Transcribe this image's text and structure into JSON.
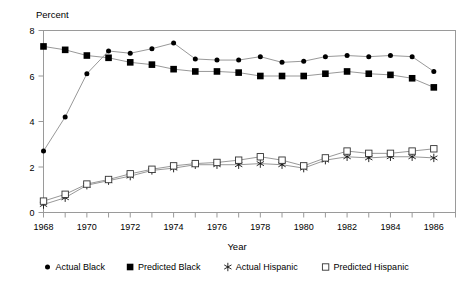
{
  "chart_data": {
    "type": "line",
    "title": "",
    "xlabel": "Year",
    "ylabel": "Percent",
    "ylim": [
      0,
      8
    ],
    "xlim": [
      1968,
      1987
    ],
    "yticks": [
      0,
      2,
      4,
      6,
      8
    ],
    "ytick_labels": [
      "0",
      "2",
      "4",
      "6",
      "8"
    ],
    "xticks": [
      1968,
      1969,
      1970,
      1971,
      1972,
      1973,
      1974,
      1975,
      1976,
      1977,
      1978,
      1979,
      1980,
      1981,
      1982,
      1983,
      1984,
      1985,
      1986,
      1987
    ],
    "xtick_labels": [
      "1968",
      "",
      "1970",
      "",
      "1972",
      "",
      "1974",
      "",
      "1976",
      "",
      "1978",
      "",
      "1980",
      "",
      "1982",
      "",
      "1984",
      "",
      "1986",
      ""
    ],
    "grid": false,
    "legend_position": "bottom",
    "x": [
      1968,
      1969,
      1970,
      1971,
      1972,
      1973,
      1974,
      1975,
      1976,
      1977,
      1978,
      1979,
      1980,
      1981,
      1982,
      1983,
      1984,
      1985,
      1986
    ],
    "series": [
      {
        "name": "Actual Black",
        "marker": "filled-circle",
        "values": [
          2.7,
          4.2,
          6.1,
          7.1,
          7.0,
          7.2,
          7.45,
          6.75,
          6.7,
          6.7,
          6.85,
          6.6,
          6.65,
          6.85,
          6.9,
          6.85,
          6.9,
          6.85,
          6.2
        ]
      },
      {
        "name": "Predicted Black",
        "marker": "filled-square",
        "values": [
          7.3,
          7.15,
          6.9,
          6.8,
          6.6,
          6.5,
          6.3,
          6.2,
          6.2,
          6.15,
          6.0,
          6.0,
          6.0,
          6.1,
          6.2,
          6.1,
          6.05,
          5.9,
          5.5
        ]
      },
      {
        "name": "Actual Hispanic",
        "marker": "star",
        "values": [
          0.35,
          0.65,
          1.2,
          1.4,
          1.6,
          1.85,
          1.95,
          2.1,
          2.1,
          2.1,
          2.15,
          2.1,
          1.95,
          2.3,
          2.45,
          2.4,
          2.45,
          2.45,
          2.4
        ]
      },
      {
        "name": "Predicted Hispanic",
        "marker": "open-square",
        "values": [
          0.5,
          0.8,
          1.25,
          1.45,
          1.7,
          1.9,
          2.05,
          2.15,
          2.2,
          2.3,
          2.45,
          2.3,
          2.05,
          2.4,
          2.7,
          2.6,
          2.6,
          2.7,
          2.8
        ]
      }
    ]
  },
  "legend": {
    "items": [
      {
        "label": "Actual Black",
        "marker": "filled-circle"
      },
      {
        "label": "Predicted Black",
        "marker": "filled-square"
      },
      {
        "label": "Actual Hispanic",
        "marker": "star"
      },
      {
        "label": "Predicted Hispanic",
        "marker": "open-square"
      }
    ]
  }
}
